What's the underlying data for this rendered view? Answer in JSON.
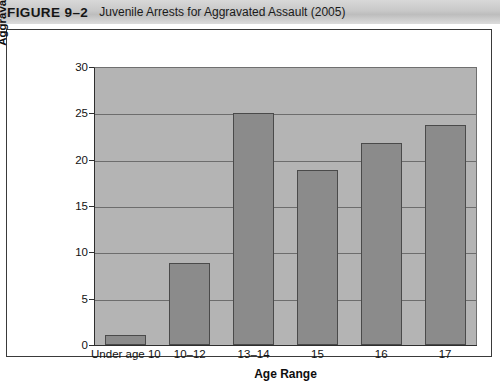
{
  "figure": {
    "number": "FIGURE 9–2",
    "title": "Juvenile Arrests for Aggravated Assault (2005)"
  },
  "colors": {
    "plot_background": "#b4b4b4",
    "bar_fill": "#8b8b8b",
    "bar_border": "#4a4a4a",
    "axis": "#2e2e2e",
    "gridline": "#6d6d6d",
    "header_band": "#c8c8c8",
    "card_border": "#3a3a3a"
  },
  "chart_data": {
    "type": "bar",
    "title": "Juvenile Arrests for Aggravated Assault (2005)",
    "categories": [
      "Under age 10",
      "10–12",
      "13–14",
      "15",
      "16",
      "17"
    ],
    "values": [
      1.1,
      8.9,
      25.0,
      18.9,
      21.8,
      23.7
    ],
    "xlabel": "Age Range",
    "ylabel": "Percentage of Juvenile Aggravated-Assault Arrests",
    "ylabel_lines": [
      "Percentage of Juvenile",
      "Aggravated-Assault Arrests"
    ],
    "ylim": [
      0,
      30
    ],
    "yticks": [
      0,
      5,
      10,
      15,
      20,
      25,
      30
    ],
    "ytick_labels": [
      "0",
      "5",
      "10",
      "15",
      "20",
      "25",
      "30"
    ],
    "grid": true,
    "legend": false
  }
}
